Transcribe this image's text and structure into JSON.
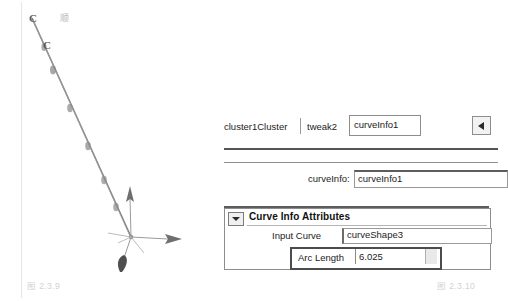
{
  "figures": {
    "left_caption": "图 2.3.9",
    "right_caption": "图 2.3.10"
  },
  "viewport": {
    "curve_labels": [
      "C",
      "C"
    ],
    "cjk_mark": "顺",
    "cluster_handle_label": "C",
    "axis_gizmo": "move-manipulator"
  },
  "attribute_editor": {
    "tabs": [
      {
        "label": "cluster1Cluster",
        "active": false
      },
      {
        "label": "tweak2",
        "active": false
      },
      {
        "label": "curveInfo1",
        "active": true
      }
    ],
    "scroll_button_icon": "triangle-left-icon",
    "node_name": {
      "label": "curveInfo:",
      "value": "curveInfo1"
    },
    "section": {
      "title": "Curve Info Attributes",
      "collapse_icon": "triangle-down-icon",
      "expanded": true,
      "fields": [
        {
          "label": "Input Curve",
          "value": "curveShape3",
          "type": "text"
        },
        {
          "label": "Arc Length",
          "value": "6.025",
          "type": "number",
          "selected": true
        }
      ]
    }
  },
  "colors": {
    "panel_border": "#8d8d8d",
    "rule_dark": "#555555",
    "field_bg": "#ffffff",
    "text": "#1c1c1c",
    "caption": "#d2d2d2",
    "curve_stroke": "#6e6e6e"
  }
}
